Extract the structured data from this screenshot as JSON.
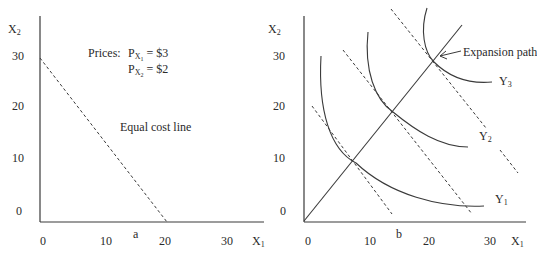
{
  "figure": {
    "panel_a": {
      "caption": "a",
      "y_axis_label": "X",
      "y_axis_sub": "2",
      "x_axis_label": "X",
      "x_axis_sub": "1",
      "y_ticks": [
        "30",
        "20",
        "10",
        "0"
      ],
      "x_ticks": [
        "0",
        "10",
        "20",
        "30"
      ],
      "prices_title": "Prices:",
      "price1_p": "P",
      "price1_x": "X",
      "price1_sub": "1",
      "price1_value": "= $3",
      "price2_p": "P",
      "price2_x": "X",
      "price2_sub": "2",
      "price2_value": "= $2",
      "line_label": "Equal cost line"
    },
    "panel_b": {
      "caption": "b",
      "y_axis_label": "X",
      "y_axis_sub": "2",
      "x_axis_label": "X",
      "x_axis_sub": "1",
      "y_ticks": [
        "30",
        "20",
        "10",
        "0"
      ],
      "x_ticks": [
        "0",
        "10",
        "20",
        "30"
      ],
      "expansion_label": "Expansion path",
      "isoquants": [
        {
          "name": "Y",
          "sub": "1"
        },
        {
          "name": "Y",
          "sub": "2"
        },
        {
          "name": "Y",
          "sub": "3"
        }
      ]
    },
    "colors": {
      "line": "#3a3a3a",
      "text": "#2a2a2a",
      "background": "#ffffff"
    }
  }
}
